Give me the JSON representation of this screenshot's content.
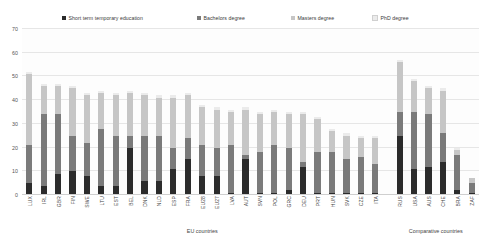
{
  "chart_data": {
    "type": "bar",
    "title": "",
    "subtitle": "",
    "stacked": true,
    "orientation": "vertical",
    "xlabel": "",
    "ylabel": "",
    "ylim": [
      0,
      70
    ],
    "yticks": [
      0,
      10,
      20,
      30,
      40,
      50,
      60,
      70
    ],
    "grid": true,
    "legend_position": "top",
    "legend": [
      "Short term temporary education",
      "Bachelors degree",
      "Masters degree",
      "PhD degree"
    ],
    "colors": {
      "short_term": "#2b2b2b",
      "bachelors": "#7a7a7a",
      "masters": "#c6c6c6",
      "phd": "#ebebeb",
      "gridline": "#e6e6e6",
      "text": "#444444",
      "background": "#ffffff"
    },
    "group_labels": [
      "EU countries",
      "Comparative countries"
    ],
    "categories": [
      "LUX",
      "IRL",
      "GBR",
      "FIN",
      "SWE",
      "LTU",
      "EST",
      "BEL",
      "DNK",
      "NLD",
      "ESP",
      "FRA",
      "EU28",
      "EU27",
      "LVA",
      "AUT",
      "SVN",
      "POL",
      "GRC",
      "DEU",
      "PRT",
      "HUN",
      "SVK",
      "CZE",
      "ITA",
      "RUS",
      "USA",
      "AUS",
      "CHE",
      "BRA",
      "ZAF"
    ],
    "series": [
      {
        "name": "Short term temporary education",
        "values": [
          5,
          4,
          9,
          10,
          8,
          4,
          4,
          20,
          6,
          6,
          11,
          15,
          8,
          8,
          1,
          15,
          1,
          1,
          2,
          12,
          1,
          1,
          1,
          1,
          1,
          25,
          11,
          12,
          14,
          2,
          1
        ]
      },
      {
        "name": "Bachelors degree",
        "values": [
          16,
          30,
          25,
          15,
          14,
          24,
          21,
          5,
          19,
          19,
          9,
          9,
          13,
          12,
          20,
          2,
          17,
          20,
          18,
          2,
          17,
          17,
          14,
          15,
          12,
          10,
          24,
          22,
          12,
          15,
          4
        ]
      },
      {
        "name": "Masters degree",
        "values": [
          30,
          12,
          12,
          20,
          20,
          15,
          17,
          18,
          17,
          16,
          21,
          18,
          16,
          16,
          14,
          19,
          16,
          14,
          14,
          20,
          14,
          9,
          10,
          8,
          11,
          21,
          13,
          11,
          18,
          2,
          2
        ]
      },
      {
        "name": "PhD degree",
        "values": [
          1,
          1,
          1,
          1,
          1,
          1,
          1,
          1,
          1,
          1,
          1,
          1,
          1,
          1,
          1,
          1,
          1,
          1,
          1,
          1,
          1,
          1,
          1,
          1,
          1,
          1,
          1,
          1,
          1,
          1,
          0
        ]
      }
    ],
    "totals": [
      52,
      47,
      47,
      46,
      43,
      44,
      43,
      44,
      43,
      42,
      42,
      43,
      38,
      37,
      36,
      37,
      35,
      36,
      35,
      34,
      33,
      28,
      26,
      25,
      25,
      57,
      49,
      46,
      45,
      19,
      7
    ]
  }
}
